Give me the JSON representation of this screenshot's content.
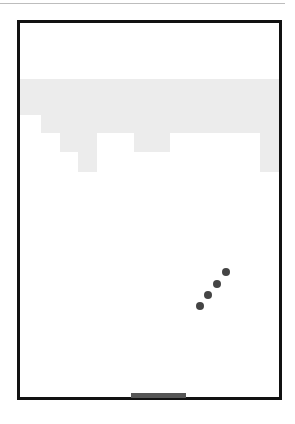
{
  "game": {
    "type": "breakout",
    "colors": {
      "frame": "#111111",
      "brick": "#ececec",
      "ball": "#444444",
      "paddle": "#555555",
      "background": "#ffffff"
    },
    "bricks": [
      {
        "x": 20,
        "y": 79,
        "w": 259,
        "h": 36
      },
      {
        "x": 41,
        "y": 115,
        "w": 238,
        "h": 18
      },
      {
        "x": 60,
        "y": 133,
        "w": 37,
        "h": 19
      },
      {
        "x": 134,
        "y": 133,
        "w": 36,
        "h": 19
      },
      {
        "x": 260,
        "y": 133,
        "w": 19,
        "h": 19
      },
      {
        "x": 78,
        "y": 152,
        "w": 19,
        "h": 20
      },
      {
        "x": 260,
        "y": 152,
        "w": 19,
        "h": 20
      }
    ],
    "balls": [
      {
        "x": 222,
        "y": 268
      },
      {
        "x": 213,
        "y": 280
      },
      {
        "x": 204,
        "y": 291
      },
      {
        "x": 196,
        "y": 302
      }
    ],
    "paddle": {
      "x": 131,
      "y": 393,
      "w": 55,
      "h": 5
    }
  }
}
